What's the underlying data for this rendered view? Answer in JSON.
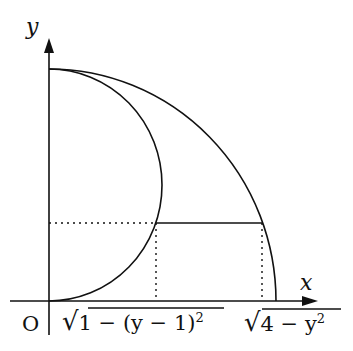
{
  "diagram": {
    "axes": {
      "x_label": "x",
      "y_label": "y",
      "origin_label": "O"
    },
    "curves": [
      {
        "name": "outer-quarter-circle",
        "equation": "x = sqrt(4 - y^2)"
      },
      {
        "name": "inner-semicircle",
        "equation": "x = sqrt(1 - (y-1)^2)"
      }
    ],
    "labels": {
      "inner_x": "√1 − (y − 1)²",
      "inner_x_radicand": "1 − (y − 1)",
      "outer_x_radicand": "4 − y",
      "sup": "2",
      "radical": "√"
    },
    "colors": {
      "stroke": "#111111",
      "background": "#ffffff"
    }
  }
}
